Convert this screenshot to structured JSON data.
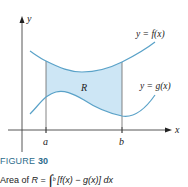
{
  "figure": {
    "axis_labels": {
      "x": "x",
      "y": "y"
    },
    "tick_labels": {
      "a": "a",
      "b": "b"
    },
    "region_label": "R",
    "curve_labels": {
      "f": "y = f(x)",
      "g": "y = g(x)"
    },
    "colors": {
      "curve": "#5aa2c8",
      "fill": "#cde6f5",
      "axis": "#444444",
      "caption_title": "#2d6c8c"
    }
  },
  "caption": {
    "figure_word": "FIGURE",
    "figure_number": "30",
    "area_prefix": "Area of",
    "region": "R",
    "equals": "=",
    "lower_limit": "a",
    "upper_limit": "b",
    "integrand": "[f(x) − g(x)] dx"
  }
}
